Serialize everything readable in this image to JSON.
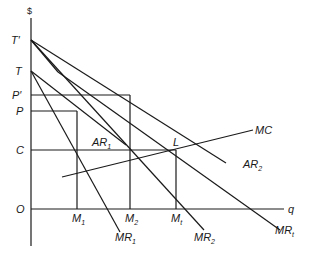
{
  "diagram": {
    "y_axis_label": "$",
    "x_axis_label": "q",
    "origin_label": "O",
    "price_labels": {
      "t_prime": "T′",
      "t": "T",
      "p_prime": "P′",
      "p": "P",
      "c": "C"
    },
    "quantity_labels": {
      "m1": {
        "base": "M",
        "sub": "1"
      },
      "m2": {
        "base": "M",
        "sub": "2"
      },
      "mt": {
        "base": "M",
        "sub": "t"
      }
    },
    "curve_labels": {
      "mc": "MC",
      "ar1": {
        "base": "AR",
        "sub": "1"
      },
      "ar2": {
        "base": "AR",
        "sub": "2"
      },
      "mr1": {
        "base": "MR",
        "sub": "1"
      },
      "mr2": {
        "base": "MR",
        "sub": "2"
      },
      "mrt": {
        "base": "MR",
        "sub": "t"
      }
    },
    "point_labels": {
      "l": "L"
    },
    "line_color": "#1a1a1a"
  }
}
